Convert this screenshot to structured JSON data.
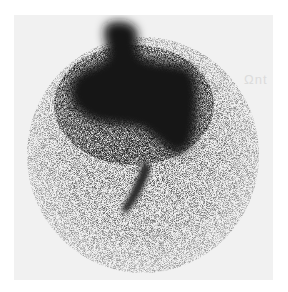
{
  "image": {
    "description": "Grayscale gamma-camera scintigraphy scan showing a circular speckled field of view with a dense dark mass in the upper center and a narrow dark streak extending downward",
    "colors": {
      "background": "#ffffff",
      "panel": "#f1f1f1",
      "dense_uptake": "#1a1a1a",
      "speckle": "#555555"
    },
    "ghost_text": "Ωnt"
  }
}
